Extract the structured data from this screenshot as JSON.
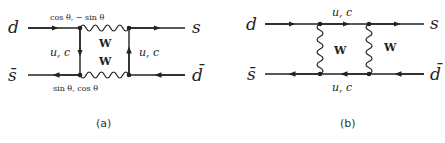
{
  "diagram_a": {
    "caption": "(a)",
    "incoming_top": "d",
    "incoming_bottom": "s̄",
    "outgoing_top": "s",
    "outgoing_bottom": "d̄",
    "top_vertex_label": "cos θ, − sin θ",
    "bottom_vertex_label": "sin θ, cos θ",
    "left_propagator": "u, c",
    "right_propagator": "u, c",
    "boson_top": "W",
    "boson_bottom": "W"
  },
  "diagram_b": {
    "caption": "(b)",
    "incoming_top": "d",
    "incoming_bottom": "s̄",
    "outgoing_top": "s",
    "outgoing_bottom": "d̄",
    "top_propagator": "u, c",
    "bottom_propagator": "u, c",
    "boson_left": "W",
    "boson_right": "W"
  },
  "colors": {
    "ink": "#222222",
    "background": "#ffffff"
  }
}
